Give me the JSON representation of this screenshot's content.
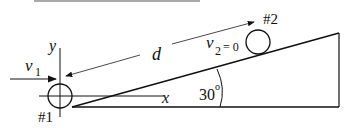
{
  "diagram": {
    "labels": {
      "y_axis": "y",
      "x_axis": "x",
      "v1": "v",
      "v1_sub": "1",
      "v2": "v",
      "v2_sub": "2",
      "v2_eq": "= 0",
      "distance": "d",
      "ball1": "#1",
      "ball2": "#2",
      "angle": "30",
      "angle_unit": "o"
    },
    "colors": {
      "stroke": "#111111",
      "background": "#ffffff"
    }
  }
}
